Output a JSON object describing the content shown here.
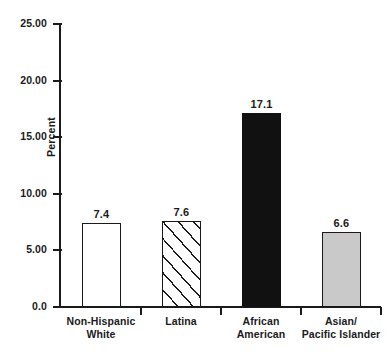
{
  "chart_data": {
    "type": "bar",
    "title": "",
    "xlabel": "",
    "ylabel": "Percent",
    "ylim": [
      0,
      25
    ],
    "grid": false,
    "legend": "none",
    "categories": [
      "Non-Hispanic White",
      "Latina",
      "African American",
      "Asian/ Pacific Islander"
    ],
    "category_lines": [
      [
        "Non-Hispanic",
        "White"
      ],
      [
        "Latina",
        ""
      ],
      [
        "African",
        "American"
      ],
      [
        "Asian/",
        "Pacific Islander"
      ]
    ],
    "values": [
      7.4,
      7.6,
      17.1,
      6.6
    ],
    "value_labels": [
      "7.4",
      "7.6",
      "17.1",
      "6.6"
    ],
    "bar_styles": [
      "none",
      "hatch",
      "black",
      "gray"
    ],
    "ytick_values": [
      25,
      20,
      15,
      10,
      5,
      0
    ],
    "ytick_labels": [
      "25.00",
      "20.00",
      "15.00",
      "10.00",
      "5.00",
      "0.0"
    ]
  },
  "colors": {
    "axis": "#1a1a1a",
    "bar_black": "#111111",
    "bar_gray": "#c9c9c9",
    "bar_white": "#ffffff",
    "background": "#ffffff"
  }
}
